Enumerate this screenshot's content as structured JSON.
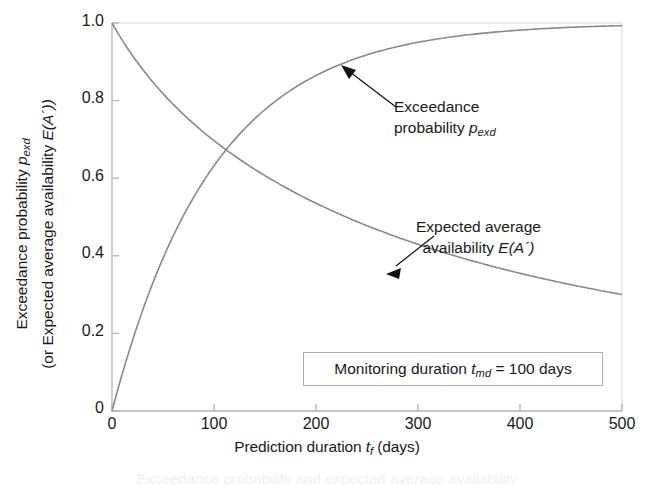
{
  "chart_data": {
    "type": "line",
    "title": "",
    "xlabel": "Prediction duration t_f (days)",
    "ylabel": "Exceedance probability p_exd (or Expected average availability E(A'))",
    "xlim": [
      0,
      500
    ],
    "ylim": [
      0,
      1.0
    ],
    "grid": false,
    "legend_position": "annotations-on-curves",
    "x_ticks": [
      0,
      100,
      200,
      300,
      400,
      500
    ],
    "y_ticks": [
      0,
      0.2,
      0.4,
      0.6,
      0.8,
      1.0
    ],
    "x": [
      0,
      25,
      50,
      75,
      100,
      125,
      150,
      175,
      200,
      225,
      250,
      275,
      300,
      325,
      350,
      375,
      400,
      425,
      450,
      475,
      500
    ],
    "series": [
      {
        "name": "Exceedance probability p_exd",
        "color": "#8a8a8a",
        "values": [
          0.0,
          0.221,
          0.393,
          0.528,
          0.632,
          0.713,
          0.777,
          0.826,
          0.865,
          0.895,
          0.918,
          0.936,
          0.95,
          0.961,
          0.97,
          0.976,
          0.982,
          0.986,
          0.989,
          0.991,
          0.993
        ]
      },
      {
        "name": "Expected average availability E(A')",
        "color": "#8a8a8a",
        "values": [
          1.0,
          0.8,
          0.667,
          0.571,
          0.63,
          0.58,
          0.535,
          0.497,
          0.463,
          0.435,
          0.41,
          0.388,
          0.368,
          0.35,
          0.333,
          0.318,
          0.304,
          0.292,
          0.281,
          0.27,
          0.2
        ]
      }
    ],
    "annotations": [
      {
        "id": "exceedance",
        "lines": [
          "Exceedance",
          "probability p_exd"
        ],
        "points_to_series": "Exceedance probability p_exd",
        "arrow_target_x": 225,
        "arrow_target_y": 0.893
      },
      {
        "id": "expected-availability",
        "lines": [
          "Expected average",
          "availability E(A')"
        ],
        "points_to_series": "Expected average availability E(A')",
        "arrow_target_x": 270,
        "arrow_target_y": 0.358
      }
    ],
    "info_box": "Monitoring duration t_md = 100 days"
  },
  "axes": {
    "y_title_line1_pre": "Exceedance probability ",
    "y_title_line1_var": "p",
    "y_title_line1_sub": "exd",
    "y_title_line2_pre": "(or Expected average availability ",
    "y_title_line2_var": "E",
    "y_title_line2_post": "(A´))",
    "x_title_pre": "Prediction duration ",
    "x_title_var": "t",
    "x_title_sub": "f",
    "x_title_post": " (days)",
    "y_tick_labels": [
      "1.0",
      "0.8",
      "0.6",
      "0.4",
      "0.2",
      "0"
    ],
    "x_tick_labels": [
      "0",
      "100",
      "200",
      "300",
      "400",
      "500"
    ]
  },
  "annotation_exceedance": {
    "line1": "Exceedance",
    "line2_pre": "probability ",
    "line2_var": "p",
    "line2_sub": "exd"
  },
  "annotation_availability": {
    "line1": "Expected average",
    "line2_pre": "availability ",
    "line2_var": "E",
    "line2_post": "(A´)"
  },
  "info_box": {
    "pre": "Monitoring duration ",
    "var": "t",
    "sub": "md",
    "post": " = 100 days"
  },
  "colors": {
    "curve": "#8a8a8a",
    "axis": "#b0b0b0",
    "text": "#1a1a1a",
    "box_border": "#aeaeae",
    "arrow": "#111111"
  },
  "caption_sliver": "Exceedance probability and expected average availability"
}
